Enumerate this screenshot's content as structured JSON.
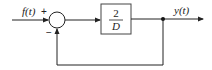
{
  "diagram": {
    "type": "block-diagram",
    "input_label": "f(t)",
    "output_label": "y(t)",
    "summing_junction": {
      "plus_sign": "+",
      "minus_sign": "−"
    },
    "block": {
      "numerator": "2",
      "denominator": "D"
    },
    "feedback": "unity negative feedback from output to summing junction"
  }
}
